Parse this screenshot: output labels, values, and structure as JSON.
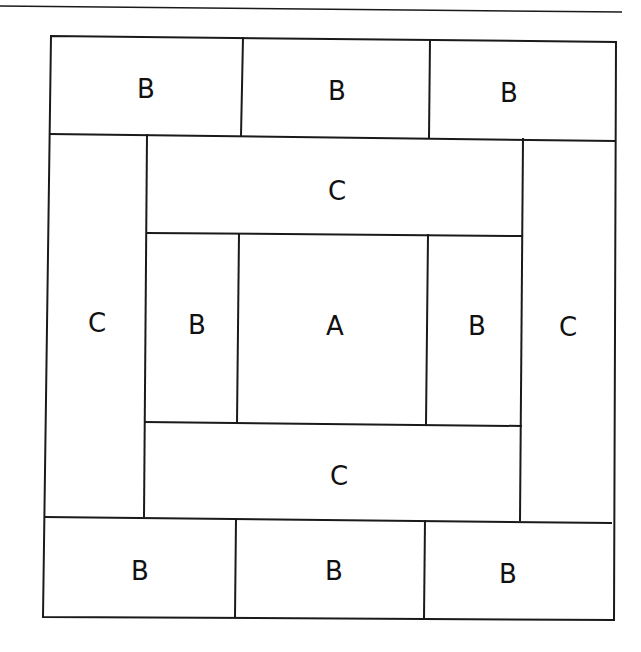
{
  "diagram": {
    "type": "quilt-block-layout",
    "colors": {
      "line": "#1a1a1a",
      "background": "#ffffff",
      "text": "#111111"
    },
    "pieces": [
      {
        "id": "top-left",
        "label": "B",
        "x": 41,
        "y": 35,
        "w": 200,
        "h": 100
      },
      {
        "id": "top-center",
        "label": "B",
        "x": 241,
        "y": 35,
        "w": 189,
        "h": 100
      },
      {
        "id": "top-right",
        "label": "B",
        "x": 430,
        "y": 35,
        "w": 186,
        "h": 100
      },
      {
        "id": "left-strip",
        "label": "C",
        "x": 41,
        "y": 135,
        "w": 105,
        "h": 385
      },
      {
        "id": "inner-top",
        "label": "C",
        "x": 146,
        "y": 135,
        "w": 376,
        "h": 100
      },
      {
        "id": "inner-left",
        "label": "B",
        "x": 146,
        "y": 235,
        "w": 92,
        "h": 190
      },
      {
        "id": "center",
        "label": "A",
        "x": 238,
        "y": 235,
        "w": 190,
        "h": 190
      },
      {
        "id": "inner-right",
        "label": "B",
        "x": 428,
        "y": 235,
        "w": 94,
        "h": 190
      },
      {
        "id": "inner-bottom",
        "label": "C",
        "x": 146,
        "y": 425,
        "w": 376,
        "h": 95
      },
      {
        "id": "right-strip",
        "label": "C",
        "x": 522,
        "y": 135,
        "w": 94,
        "h": 385
      },
      {
        "id": "bottom-left",
        "label": "B",
        "x": 41,
        "y": 520,
        "w": 194,
        "h": 100
      },
      {
        "id": "bottom-center",
        "label": "B",
        "x": 235,
        "y": 520,
        "w": 189,
        "h": 100
      },
      {
        "id": "bottom-right",
        "label": "B",
        "x": 424,
        "y": 520,
        "w": 192,
        "h": 100
      }
    ]
  },
  "labels": {
    "top_left": "B",
    "top_center": "B",
    "top_right": "B",
    "left_strip": "C",
    "inner_top": "C",
    "inner_left": "B",
    "center": "A",
    "inner_right": "B",
    "inner_bottom": "C",
    "right_strip": "C",
    "bottom_left": "B",
    "bottom_center": "B",
    "bottom_right": "B"
  }
}
